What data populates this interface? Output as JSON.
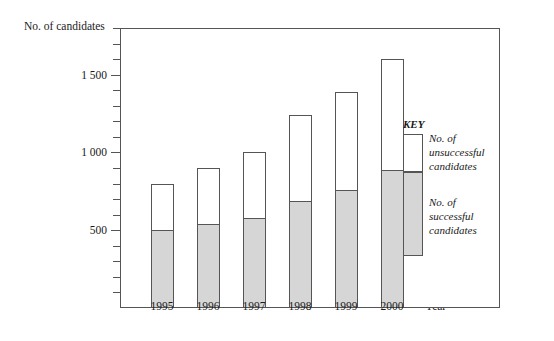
{
  "chart_data": {
    "type": "bar",
    "subtype": "stacked-bar",
    "title": "",
    "xlabel": "Year",
    "ylabel": "No. of candidates",
    "categories": [
      "1995",
      "1996",
      "1997",
      "1998",
      "1999",
      "2000"
    ],
    "series": [
      {
        "name": "No. of successful candidates",
        "values": [
          500,
          540,
          580,
          690,
          760,
          890
        ],
        "color": "#d6d6d6"
      },
      {
        "name": "No. of unsuccessful candidates",
        "values": [
          300,
          360,
          420,
          550,
          630,
          710
        ],
        "color": "#ffffff"
      }
    ],
    "totals": [
      800,
      900,
      1000,
      1240,
      1390,
      1600
    ],
    "ylim": [
      0,
      1800
    ],
    "ytick_labeled": [
      {
        "value": 500,
        "label": "500"
      },
      {
        "value": 1000,
        "label": "1 000"
      },
      {
        "value": 1500,
        "label": "1 500"
      }
    ],
    "ytick_step": 100,
    "grid": false,
    "legend_position": "right-inside"
  },
  "axes": {
    "y_title": "No. of candidates",
    "x_title": "Year"
  },
  "legend": {
    "title": "KEY",
    "entries": [
      {
        "label_line1": "No. of unsuccessful",
        "label_line2": "candidates",
        "swatch": "white"
      },
      {
        "label_line1": "No. of successful",
        "label_line2": "candidates",
        "swatch": "gray"
      }
    ]
  }
}
